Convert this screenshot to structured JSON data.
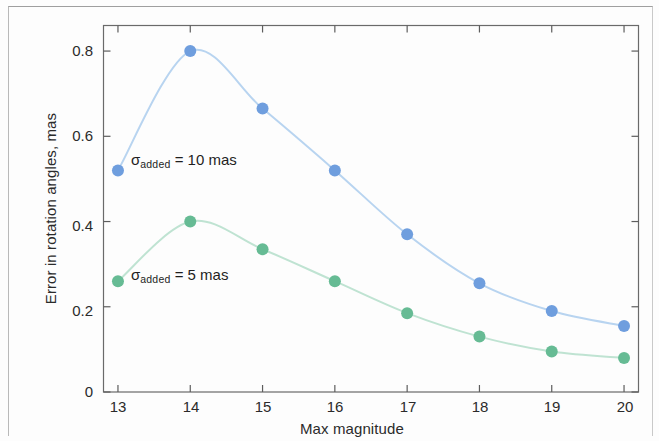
{
  "figure": {
    "xlabel": "Max magnitude",
    "ylabel": "Error in rotation angles, mas",
    "x_ticks": [
      "13",
      "14",
      "15",
      "16",
      "17",
      "18",
      "19",
      "20"
    ],
    "y_ticks": [
      "0",
      "0.2",
      "0.4",
      "0.6",
      "0.8"
    ],
    "annotation_blue_prefix": "σ",
    "annotation_blue_sub": "added",
    "annotation_blue_rest": " = 10 mas",
    "annotation_green_prefix": "σ",
    "annotation_green_sub": "added",
    "annotation_green_rest": " = 5 mas",
    "colors": {
      "blue_marker": "#6f9ede",
      "blue_line": "#b8d4f0",
      "green_marker": "#66bb94",
      "green_line": "#bfe3d2",
      "axis": "#5d5d5d",
      "text": "#2b2b2b"
    }
  },
  "chart_data": {
    "type": "line",
    "title": "",
    "xlabel": "Max magnitude",
    "ylabel": "Error in rotation angles, mas",
    "x": [
      13,
      14,
      15,
      16,
      17,
      18,
      19,
      20
    ],
    "xlim": [
      12.8,
      20.2
    ],
    "ylim": [
      0,
      0.86
    ],
    "x_tick_values": [
      13,
      14,
      15,
      16,
      17,
      18,
      19,
      20
    ],
    "y_tick_values": [
      0,
      0.2,
      0.4,
      0.6,
      0.8
    ],
    "grid": false,
    "legend": "inline-annotations",
    "series": [
      {
        "name": "σ_added = 10 mas",
        "color": "#6f9ede",
        "line_color": "#b8d4f0",
        "marker": "circle",
        "values": [
          0.52,
          0.8,
          0.665,
          0.52,
          0.37,
          0.255,
          0.19,
          0.155
        ]
      },
      {
        "name": "σ_added = 5 mas",
        "color": "#66bb94",
        "line_color": "#bfe3d2",
        "marker": "circle",
        "values": [
          0.26,
          0.4,
          0.335,
          0.26,
          0.185,
          0.13,
          0.095,
          0.08
        ]
      }
    ],
    "annotations": [
      {
        "text": "σ_added = 10 mas",
        "x": 13.35,
        "y": 0.565
      },
      {
        "text": "σ_added = 5 mas",
        "x": 13.35,
        "y": 0.295
      }
    ]
  }
}
